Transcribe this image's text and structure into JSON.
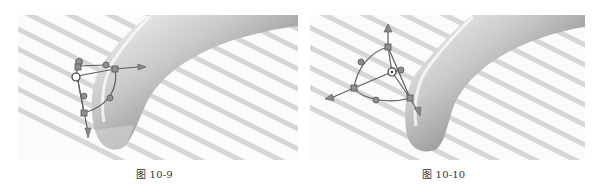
{
  "figures": [
    {
      "id": "left",
      "caption": "图 10-9",
      "description": "3D tube surface rendered with zebra stripes; manipulator handle with control points positioned at left of tube end"
    },
    {
      "id": "right",
      "caption": "图 10-10",
      "description": "3D tube surface rendered with zebra stripes; manipulator handle rotated with three arrow axes and spherical-triangle control frame"
    }
  ],
  "colors": {
    "background": "#ffffff",
    "stripe": "#d4d4d4",
    "surface_dark": "#6e6e6e",
    "surface_light": "#f2f2f2",
    "handle": "#6a6a6a",
    "handle_fill": "#9a9a9a"
  }
}
